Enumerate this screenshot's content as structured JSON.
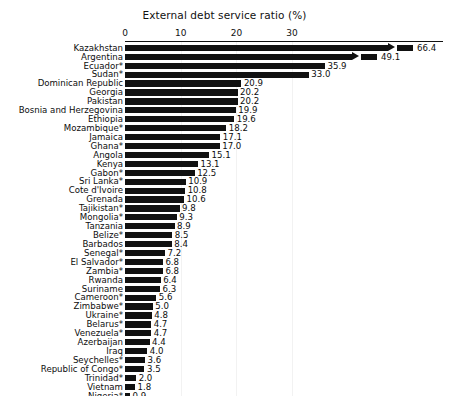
{
  "chart_data": {
    "type": "bar",
    "orientation": "horizontal",
    "title": "External debt service ratio (%)",
    "xlabel": "",
    "ylabel": "",
    "xlim": [
      0,
      37
    ],
    "xticks": [
      0,
      10,
      20,
      30
    ],
    "xtick_labels": [
      "0",
      "10",
      "20",
      "30"
    ],
    "grid": "faint vertical gridlines at ticks",
    "legend": "none",
    "bar_color": "#111111",
    "axis_note": "Top two bars (Kazakhstan 66.4, Argentina 49.1) exceed the axis range and are drawn with a break: an arrowhead terminates the bar, followed by a detached stub segment before the value label.",
    "categories": [
      "Kazakhstan",
      "Argentina",
      "Ecuador*",
      "Sudan*",
      "Dominican Republic",
      "Georgia",
      "Pakistan",
      "Bosnia and Herzegovina",
      "Ethiopia",
      "Mozambique*",
      "Jamaica",
      "Ghana*",
      "Angola",
      "Kenya",
      "Gabon*",
      "Sri Lanka*",
      "Cote d'Ivoire",
      "Grenada",
      "Tajikistan*",
      "Mongolia*",
      "Tanzania",
      "Belize*",
      "Barbados",
      "Senegal*",
      "El Salvador*",
      "Zambia*",
      "Rwanda",
      "Suriname",
      "Cameroon*",
      "Zimbabwe*",
      "Ukraine*",
      "Belarus*",
      "Venezuela*",
      "Azerbaijan",
      "Iraq",
      "Seychelles*",
      "Republic of Congo*",
      "Trinidad*",
      "Vietnam",
      "Nigeria*"
    ],
    "values": [
      66.4,
      49.1,
      35.9,
      33.0,
      20.9,
      20.2,
      20.2,
      19.9,
      19.6,
      18.2,
      17.1,
      17.0,
      15.1,
      13.1,
      12.5,
      10.9,
      10.8,
      10.6,
      9.8,
      9.3,
      8.9,
      8.5,
      8.4,
      7.2,
      6.8,
      6.8,
      6.4,
      6.3,
      5.6,
      5.0,
      4.8,
      4.7,
      4.7,
      4.4,
      4.0,
      3.6,
      3.5,
      2.0,
      1.8,
      0.9
    ],
    "value_labels": [
      "66.4",
      "49.1",
      "35.9",
      "33.0",
      "20.9",
      "20.2",
      "20.2",
      "19.9",
      "19.6",
      "18.2",
      "17.1",
      "17.0",
      "15.1",
      "13.1",
      "12.5",
      "10.9",
      "10.8",
      "10.6",
      "9.8",
      "9.3",
      "8.9",
      "8.5",
      "8.4",
      "7.2",
      "6.8",
      "6.8",
      "6.4",
      "6.3",
      "5.6",
      "5.0",
      "4.8",
      "4.7",
      "4.7",
      "4.4",
      "4.0",
      "3.6",
      "3.5",
      "2.0",
      "1.8",
      "0.9"
    ],
    "broken": [
      true,
      true,
      false,
      false,
      false,
      false,
      false,
      false,
      false,
      false,
      false,
      false,
      false,
      false,
      false,
      false,
      false,
      false,
      false,
      false,
      false,
      false,
      false,
      false,
      false,
      false,
      false,
      false,
      false,
      false,
      false,
      false,
      false,
      false,
      false,
      false,
      false,
      false,
      false,
      false
    ]
  }
}
